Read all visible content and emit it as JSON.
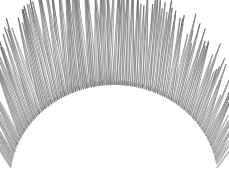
{
  "figure": {
    "title": "",
    "caption": "",
    "background_color": "#ffffff",
    "width": 229,
    "height": 184,
    "render_type": "radial-needle-glyph-dome"
  },
  "chart_data": {
    "type": "scatter",
    "title": "",
    "subtitle": "",
    "xlabel": "",
    "ylabel": "",
    "xlim": [
      0,
      229
    ],
    "ylim": [
      0,
      184
    ],
    "grid": false,
    "legend": null,
    "tick_labels_x": [],
    "tick_labels_y": [],
    "annotations": [],
    "geometry": {
      "dome_center_x": 114,
      "dome_center_y": 181,
      "dome_radius_x": 104,
      "dome_radius_y": 96,
      "angle_start_deg": 188,
      "angle_end_deg": 352,
      "needle_count": 150,
      "needle_length_min": 26,
      "needle_length_max": 118,
      "needle_half_width_min": 1.0,
      "needle_half_width_max": 2.6,
      "tilt_range_deg": [
        -34,
        34
      ]
    },
    "palette": {
      "stroke_dark": "#4a4a4a",
      "stroke_mid": "#7d7d7d",
      "stroke_light": "#b8b8b8",
      "fill_light": "#e8e8e8",
      "fill_white": "#fdfdfd",
      "background": "#ffffff"
    },
    "series": [
      {
        "name": "needles",
        "values": [
          {
            "t": 0.0,
            "len": 30,
            "w": 1.0,
            "shade": 0.42
          },
          {
            "t": 0.007,
            "len": 34,
            "w": 1.1,
            "shade": 0.55
          },
          {
            "t": 0.013,
            "len": 28,
            "w": 1.0,
            "shade": 0.3
          },
          {
            "t": 0.02,
            "len": 40,
            "w": 1.2,
            "shade": 0.6
          },
          {
            "t": 0.027,
            "len": 36,
            "w": 1.1,
            "shade": 0.35
          },
          {
            "t": 0.034,
            "len": 44,
            "w": 1.3,
            "shade": 0.7
          },
          {
            "t": 0.04,
            "len": 38,
            "w": 1.1,
            "shade": 0.28
          },
          {
            "t": 0.047,
            "len": 50,
            "w": 1.4,
            "shade": 0.62
          },
          {
            "t": 0.054,
            "len": 42,
            "w": 1.2,
            "shade": 0.4
          },
          {
            "t": 0.06,
            "len": 56,
            "w": 1.5,
            "shade": 0.75
          },
          {
            "t": 0.067,
            "len": 48,
            "w": 1.3,
            "shade": 0.33
          },
          {
            "t": 0.074,
            "len": 60,
            "w": 1.6,
            "shade": 0.68
          },
          {
            "t": 0.081,
            "len": 52,
            "w": 1.4,
            "shade": 0.45
          },
          {
            "t": 0.087,
            "len": 66,
            "w": 1.7,
            "shade": 0.8
          },
          {
            "t": 0.094,
            "len": 58,
            "w": 1.5,
            "shade": 0.36
          },
          {
            "t": 0.101,
            "len": 70,
            "w": 1.8,
            "shade": 0.66
          },
          {
            "t": 0.107,
            "len": 62,
            "w": 1.6,
            "shade": 0.48
          },
          {
            "t": 0.114,
            "len": 74,
            "w": 1.9,
            "shade": 0.82
          },
          {
            "t": 0.121,
            "len": 66,
            "w": 1.7,
            "shade": 0.38
          },
          {
            "t": 0.128,
            "len": 78,
            "w": 2.0,
            "shade": 0.7
          },
          {
            "t": 0.134,
            "len": 70,
            "w": 1.8,
            "shade": 0.5
          },
          {
            "t": 0.141,
            "len": 82,
            "w": 2.1,
            "shade": 0.85
          },
          {
            "t": 0.148,
            "len": 74,
            "w": 1.9,
            "shade": 0.4
          },
          {
            "t": 0.154,
            "len": 86,
            "w": 2.2,
            "shade": 0.72
          },
          {
            "t": 0.161,
            "len": 78,
            "w": 2.0,
            "shade": 0.52
          },
          {
            "t": 0.168,
            "len": 90,
            "w": 2.3,
            "shade": 0.88
          },
          {
            "t": 0.174,
            "len": 82,
            "w": 2.1,
            "shade": 0.42
          },
          {
            "t": 0.181,
            "len": 94,
            "w": 2.4,
            "shade": 0.74
          },
          {
            "t": 0.188,
            "len": 86,
            "w": 2.2,
            "shade": 0.54
          },
          {
            "t": 0.195,
            "len": 98,
            "w": 2.5,
            "shade": 0.86
          },
          {
            "t": 0.201,
            "len": 90,
            "w": 2.3,
            "shade": 0.44
          },
          {
            "t": 0.208,
            "len": 100,
            "w": 2.5,
            "shade": 0.76
          },
          {
            "t": 0.215,
            "len": 92,
            "w": 2.3,
            "shade": 0.56
          },
          {
            "t": 0.221,
            "len": 104,
            "w": 2.6,
            "shade": 0.9
          },
          {
            "t": 0.228,
            "len": 94,
            "w": 2.4,
            "shade": 0.46
          },
          {
            "t": 0.235,
            "len": 106,
            "w": 2.6,
            "shade": 0.78
          },
          {
            "t": 0.242,
            "len": 96,
            "w": 2.4,
            "shade": 0.58
          },
          {
            "t": 0.248,
            "len": 108,
            "w": 2.6,
            "shade": 0.88
          },
          {
            "t": 0.255,
            "len": 98,
            "w": 2.5,
            "shade": 0.48
          },
          {
            "t": 0.262,
            "len": 110,
            "w": 2.6,
            "shade": 0.8
          },
          {
            "t": 0.268,
            "len": 100,
            "w": 2.5,
            "shade": 0.6
          },
          {
            "t": 0.275,
            "len": 112,
            "w": 2.6,
            "shade": 0.92
          },
          {
            "t": 0.282,
            "len": 102,
            "w": 2.5,
            "shade": 0.5
          },
          {
            "t": 0.289,
            "len": 114,
            "w": 2.6,
            "shade": 0.82
          },
          {
            "t": 0.295,
            "len": 104,
            "w": 2.5,
            "shade": 0.62
          },
          {
            "t": 0.302,
            "len": 116,
            "w": 2.6,
            "shade": 0.9
          },
          {
            "t": 0.309,
            "len": 106,
            "w": 2.5,
            "shade": 0.52
          },
          {
            "t": 0.315,
            "len": 118,
            "w": 2.6,
            "shade": 0.84
          },
          {
            "t": 0.322,
            "len": 108,
            "w": 2.5,
            "shade": 0.64
          },
          {
            "t": 0.329,
            "len": 116,
            "w": 2.6,
            "shade": 0.94
          },
          {
            "t": 0.336,
            "len": 106,
            "w": 2.5,
            "shade": 0.54
          },
          {
            "t": 0.342,
            "len": 118,
            "w": 2.6,
            "shade": 0.86
          },
          {
            "t": 0.349,
            "len": 108,
            "w": 2.5,
            "shade": 0.66
          },
          {
            "t": 0.356,
            "len": 116,
            "w": 2.6,
            "shade": 0.92
          },
          {
            "t": 0.362,
            "len": 104,
            "w": 2.5,
            "shade": 0.56
          },
          {
            "t": 0.369,
            "len": 118,
            "w": 2.6,
            "shade": 0.88
          },
          {
            "t": 0.376,
            "len": 106,
            "w": 2.5,
            "shade": 0.68
          },
          {
            "t": 0.383,
            "len": 114,
            "w": 2.6,
            "shade": 0.9
          },
          {
            "t": 0.389,
            "len": 102,
            "w": 2.5,
            "shade": 0.58
          },
          {
            "t": 0.396,
            "len": 116,
            "w": 2.6,
            "shade": 0.84
          },
          {
            "t": 0.403,
            "len": 104,
            "w": 2.5,
            "shade": 0.7
          },
          {
            "t": 0.409,
            "len": 112,
            "w": 2.6,
            "shade": 0.92
          },
          {
            "t": 0.416,
            "len": 100,
            "w": 2.5,
            "shade": 0.6
          },
          {
            "t": 0.423,
            "len": 114,
            "w": 2.6,
            "shade": 0.86
          },
          {
            "t": 0.43,
            "len": 102,
            "w": 2.5,
            "shade": 0.72
          },
          {
            "t": 0.436,
            "len": 110,
            "w": 2.6,
            "shade": 0.9
          },
          {
            "t": 0.443,
            "len": 98,
            "w": 2.5,
            "shade": 0.62
          },
          {
            "t": 0.45,
            "len": 112,
            "w": 2.6,
            "shade": 0.88
          },
          {
            "t": 0.456,
            "len": 100,
            "w": 2.5,
            "shade": 0.74
          },
          {
            "t": 0.463,
            "len": 108,
            "w": 2.6,
            "shade": 0.92
          },
          {
            "t": 0.47,
            "len": 96,
            "w": 2.5,
            "shade": 0.64
          },
          {
            "t": 0.477,
            "len": 110,
            "w": 2.6,
            "shade": 0.86
          },
          {
            "t": 0.483,
            "len": 98,
            "w": 2.5,
            "shade": 0.76
          },
          {
            "t": 0.49,
            "len": 106,
            "w": 2.6,
            "shade": 0.94
          },
          {
            "t": 0.497,
            "len": 94,
            "w": 2.5,
            "shade": 0.66
          },
          {
            "t": 0.503,
            "len": 108,
            "w": 2.6,
            "shade": 0.88
          },
          {
            "t": 0.51,
            "len": 96,
            "w": 2.5,
            "shade": 0.78
          },
          {
            "t": 0.517,
            "len": 104,
            "w": 2.6,
            "shade": 0.92
          },
          {
            "t": 0.524,
            "len": 92,
            "w": 2.5,
            "shade": 0.68
          },
          {
            "t": 0.53,
            "len": 106,
            "w": 2.6,
            "shade": 0.86
          },
          {
            "t": 0.537,
            "len": 94,
            "w": 2.5,
            "shade": 0.8
          },
          {
            "t": 0.544,
            "len": 102,
            "w": 2.6,
            "shade": 0.9
          },
          {
            "t": 0.55,
            "len": 90,
            "w": 2.5,
            "shade": 0.62
          },
          {
            "t": 0.557,
            "len": 104,
            "w": 2.6,
            "shade": 0.84
          },
          {
            "t": 0.564,
            "len": 92,
            "w": 2.5,
            "shade": 0.74
          },
          {
            "t": 0.571,
            "len": 100,
            "w": 2.5,
            "shade": 0.92
          },
          {
            "t": 0.577,
            "len": 88,
            "w": 2.4,
            "shade": 0.58
          },
          {
            "t": 0.584,
            "len": 102,
            "w": 2.5,
            "shade": 0.82
          },
          {
            "t": 0.591,
            "len": 90,
            "w": 2.4,
            "shade": 0.7
          },
          {
            "t": 0.597,
            "len": 98,
            "w": 2.5,
            "shade": 0.9
          },
          {
            "t": 0.604,
            "len": 86,
            "w": 2.4,
            "shade": 0.54
          },
          {
            "t": 0.611,
            "len": 100,
            "w": 2.5,
            "shade": 0.8
          },
          {
            "t": 0.618,
            "len": 88,
            "w": 2.4,
            "shade": 0.68
          },
          {
            "t": 0.624,
            "len": 96,
            "w": 2.5,
            "shade": 0.88
          },
          {
            "t": 0.631,
            "len": 84,
            "w": 2.3,
            "shade": 0.5
          },
          {
            "t": 0.638,
            "len": 98,
            "w": 2.5,
            "shade": 0.78
          },
          {
            "t": 0.644,
            "len": 86,
            "w": 2.3,
            "shade": 0.66
          },
          {
            "t": 0.651,
            "len": 94,
            "w": 2.4,
            "shade": 0.86
          },
          {
            "t": 0.658,
            "len": 82,
            "w": 2.3,
            "shade": 0.48
          },
          {
            "t": 0.664,
            "len": 96,
            "w": 2.4,
            "shade": 0.76
          },
          {
            "t": 0.671,
            "len": 84,
            "w": 2.3,
            "shade": 0.64
          },
          {
            "t": 0.678,
            "len": 90,
            "w": 2.4,
            "shade": 0.84
          },
          {
            "t": 0.685,
            "len": 78,
            "w": 2.2,
            "shade": 0.46
          },
          {
            "t": 0.691,
            "len": 92,
            "w": 2.4,
            "shade": 0.74
          },
          {
            "t": 0.698,
            "len": 80,
            "w": 2.2,
            "shade": 0.62
          },
          {
            "t": 0.705,
            "len": 86,
            "w": 2.3,
            "shade": 0.82
          },
          {
            "t": 0.711,
            "len": 74,
            "w": 2.1,
            "shade": 0.44
          },
          {
            "t": 0.718,
            "len": 88,
            "w": 2.3,
            "shade": 0.72
          },
          {
            "t": 0.725,
            "len": 76,
            "w": 2.1,
            "shade": 0.6
          },
          {
            "t": 0.732,
            "len": 82,
            "w": 2.2,
            "shade": 0.8
          },
          {
            "t": 0.738,
            "len": 70,
            "w": 2.0,
            "shade": 0.42
          },
          {
            "t": 0.745,
            "len": 84,
            "w": 2.2,
            "shade": 0.7
          },
          {
            "t": 0.752,
            "len": 72,
            "w": 2.0,
            "shade": 0.58
          },
          {
            "t": 0.758,
            "len": 78,
            "w": 2.1,
            "shade": 0.78
          },
          {
            "t": 0.765,
            "len": 66,
            "w": 1.9,
            "shade": 0.4
          },
          {
            "t": 0.772,
            "len": 80,
            "w": 2.1,
            "shade": 0.68
          },
          {
            "t": 0.779,
            "len": 68,
            "w": 1.9,
            "shade": 0.56
          },
          {
            "t": 0.785,
            "len": 74,
            "w": 2.0,
            "shade": 0.76
          },
          {
            "t": 0.792,
            "len": 62,
            "w": 1.8,
            "shade": 0.38
          },
          {
            "t": 0.799,
            "len": 76,
            "w": 2.0,
            "shade": 0.66
          },
          {
            "t": 0.805,
            "len": 64,
            "w": 1.8,
            "shade": 0.54
          },
          {
            "t": 0.812,
            "len": 70,
            "w": 1.9,
            "shade": 0.74
          },
          {
            "t": 0.819,
            "len": 58,
            "w": 1.7,
            "shade": 0.36
          },
          {
            "t": 0.826,
            "len": 72,
            "w": 1.9,
            "shade": 0.64
          },
          {
            "t": 0.832,
            "len": 60,
            "w": 1.7,
            "shade": 0.52
          },
          {
            "t": 0.839,
            "len": 64,
            "w": 1.8,
            "shade": 0.72
          },
          {
            "t": 0.846,
            "len": 52,
            "w": 1.6,
            "shade": 0.34
          },
          {
            "t": 0.852,
            "len": 66,
            "w": 1.8,
            "shade": 0.62
          },
          {
            "t": 0.859,
            "len": 54,
            "w": 1.6,
            "shade": 0.5
          },
          {
            "t": 0.866,
            "len": 58,
            "w": 1.7,
            "shade": 0.7
          },
          {
            "t": 0.873,
            "len": 46,
            "w": 1.5,
            "shade": 0.32
          },
          {
            "t": 0.879,
            "len": 60,
            "w": 1.7,
            "shade": 0.6
          },
          {
            "t": 0.886,
            "len": 48,
            "w": 1.5,
            "shade": 0.48
          },
          {
            "t": 0.893,
            "len": 52,
            "w": 1.6,
            "shade": 0.68
          },
          {
            "t": 0.899,
            "len": 42,
            "w": 1.4,
            "shade": 0.3
          },
          {
            "t": 0.906,
            "len": 54,
            "w": 1.6,
            "shade": 0.58
          },
          {
            "t": 0.913,
            "len": 44,
            "w": 1.4,
            "shade": 0.46
          },
          {
            "t": 0.919,
            "len": 46,
            "w": 1.4,
            "shade": 0.66
          },
          {
            "t": 0.926,
            "len": 38,
            "w": 1.3,
            "shade": 0.28
          },
          {
            "t": 0.933,
            "len": 48,
            "w": 1.4,
            "shade": 0.56
          },
          {
            "t": 0.94,
            "len": 40,
            "w": 1.3,
            "shade": 0.44
          },
          {
            "t": 0.946,
            "len": 40,
            "w": 1.3,
            "shade": 0.62
          },
          {
            "t": 0.953,
            "len": 34,
            "w": 1.2,
            "shade": 0.26
          },
          {
            "t": 0.96,
            "len": 42,
            "w": 1.3,
            "shade": 0.52
          },
          {
            "t": 0.966,
            "len": 34,
            "w": 1.2,
            "shade": 0.4
          },
          {
            "t": 0.973,
            "len": 34,
            "w": 1.1,
            "shade": 0.58
          },
          {
            "t": 0.98,
            "len": 28,
            "w": 1.1,
            "shade": 0.24
          },
          {
            "t": 0.987,
            "len": 32,
            "w": 1.1,
            "shade": 0.46
          },
          {
            "t": 1.0,
            "len": 26,
            "w": 1.0,
            "shade": 0.34
          }
        ]
      }
    ]
  }
}
